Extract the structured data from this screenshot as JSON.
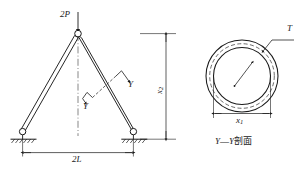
{
  "figure": {
    "background_color": "#ffffff",
    "line_color": "#1a1a1a",
    "left_view": {
      "load_label": "2P",
      "load_arrow": "down-arrow-icon",
      "apex_joint": "pin-joint-icon",
      "left_support": "pin-support-icon",
      "right_support": "pin-support-icon",
      "centerline": "dash-dot-centerline",
      "section_cut_label_upper": "Y",
      "section_cut_label_lower": "Y",
      "span_dimension": "2L",
      "height_dimension_base": "x",
      "height_dimension_sub": "2"
    },
    "right_view": {
      "thickness_label": "T",
      "diameter_dimension_base": "x",
      "diameter_dimension_sub": "1",
      "radius_arrow": "radius-arrow-icon",
      "mid_circle": "dashed-mid-wall-circle",
      "caption_left": "Y",
      "caption_dash": "—",
      "caption_right": "Y",
      "caption_cn": "剖面",
      "caption_full": "Y—Y剖面"
    }
  }
}
